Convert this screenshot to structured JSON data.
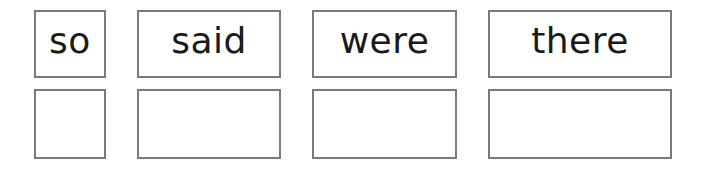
{
  "worksheet": {
    "words": [
      {
        "label": "so"
      },
      {
        "label": "said"
      },
      {
        "label": "were"
      },
      {
        "label": "there"
      }
    ],
    "answer_boxes": [
      {
        "value": ""
      },
      {
        "value": ""
      },
      {
        "value": ""
      },
      {
        "value": ""
      }
    ],
    "colors": {
      "border": "#7a7a7a",
      "text": "#1a1a1a",
      "background": "#ffffff"
    }
  }
}
